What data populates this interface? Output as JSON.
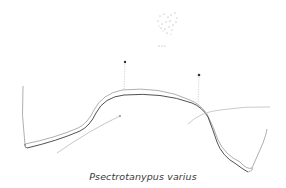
{
  "figure": {
    "caption": "Psectrotanypus varius",
    "colors": {
      "background": "#ffffff",
      "stroke_dark": "#3d3d3d",
      "stroke_light": "#9a9a9a",
      "stroke_faint": "#c4c4c4"
    },
    "markers": [
      {
        "id": "a",
        "x": 125,
        "y": 62
      },
      {
        "id": "b",
        "x": 199,
        "y": 75
      }
    ]
  }
}
